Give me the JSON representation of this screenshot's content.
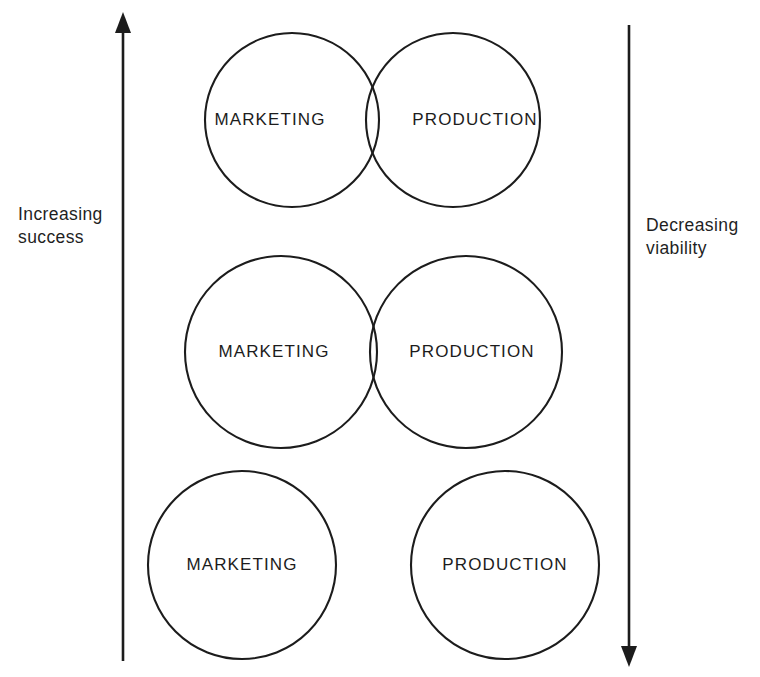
{
  "figure": {
    "type": "venn-overlap-progression",
    "background_color": "#ffffff",
    "stroke_color": "#1c1c1c",
    "width": 760,
    "height": 677
  },
  "axes": {
    "left": {
      "label": "Increasing\nsuccess",
      "direction": "up",
      "arrow_icon": "arrow-up-icon"
    },
    "right": {
      "label": "Decreasing\nviability",
      "direction": "down",
      "arrow_icon": "arrow-down-icon"
    }
  },
  "rows": [
    {
      "id": "row-high-overlap",
      "overlap": "large",
      "left_circle": {
        "label": "MARKETING",
        "cx": 292,
        "cy": 120,
        "r": 87
      },
      "right_circle": {
        "label": "PRODUCTION",
        "cx": 453,
        "cy": 120,
        "r": 87
      },
      "left_label_x": 270,
      "right_label_x": 475
    },
    {
      "id": "row-slight-overlap",
      "overlap": "slight",
      "left_circle": {
        "label": "MARKETING",
        "cx": 281,
        "cy": 352,
        "r": 96
      },
      "right_circle": {
        "label": "PRODUCTION",
        "cx": 466,
        "cy": 352,
        "r": 96
      },
      "left_label_x": 274,
      "right_label_x": 472
    },
    {
      "id": "row-no-overlap",
      "overlap": "none",
      "left_circle": {
        "label": "MARKETING",
        "cx": 242,
        "cy": 565,
        "r": 94
      },
      "right_circle": {
        "label": "PRODUCTION",
        "cx": 505,
        "cy": 565,
        "r": 94
      },
      "left_label_x": 242,
      "right_label_x": 505
    }
  ]
}
